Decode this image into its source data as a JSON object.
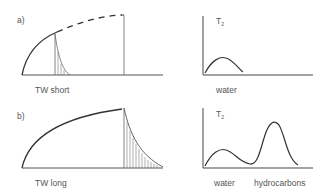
{
  "panels": [
    {
      "id": "a",
      "label": "a)",
      "wait_label": "TW short",
      "spectrum": {
        "axis_label": "T",
        "axis_sub": "2",
        "peaks": [
          {
            "label": "water"
          }
        ]
      }
    },
    {
      "id": "b",
      "label": "b)",
      "wait_label": "TW long",
      "spectrum": {
        "axis_label": "T",
        "axis_sub": "2",
        "peaks": [
          {
            "label": "water"
          },
          {
            "label": "hydrocarbons"
          }
        ]
      }
    }
  ],
  "colors": {
    "line": "#444444",
    "thin": "#777777",
    "text": "#555555"
  }
}
